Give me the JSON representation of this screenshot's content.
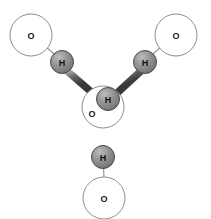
{
  "figure": {
    "background_color": "#ffffff",
    "width": 211,
    "height": 219
  },
  "style": {
    "oxygen_fill": "#ffffff",
    "oxygen_stroke": "#8d8d8d",
    "hydrogen_fill_light": "#b4b4b4",
    "hydrogen_fill_mid": "#8c8c8c",
    "hydrogen_fill_dark": "#6e6e6e",
    "hydrogen_stroke": "#4a4a4a",
    "covalent_bond_dark": "#3c3c3c",
    "covalent_bond_light": "#b9b9b9",
    "hydrogen_bond_color": "#9a9a9a",
    "label_color": "#1a1a1a"
  },
  "atoms": [
    {
      "id": "o-center",
      "element": "O",
      "label": "O",
      "kind": "oxygen",
      "cx": 103,
      "cy": 107,
      "r": 21,
      "label_x": 92,
      "label_y": 113
    },
    {
      "id": "o-top-left",
      "element": "O",
      "label": "O",
      "kind": "oxygen",
      "cx": 31,
      "cy": 35,
      "r": 21,
      "label_x": 31,
      "label_y": 35
    },
    {
      "id": "o-top-right",
      "element": "O",
      "label": "O",
      "kind": "oxygen",
      "cx": 176,
      "cy": 35,
      "r": 21,
      "label_x": 176,
      "label_y": 35
    },
    {
      "id": "o-bottom",
      "element": "O",
      "label": "O",
      "kind": "oxygen",
      "cx": 104,
      "cy": 198,
      "r": 21,
      "label_x": 104,
      "label_y": 198
    },
    {
      "id": "h-center",
      "element": "H",
      "label": "H",
      "kind": "hydrogen",
      "cx": 108,
      "cy": 99,
      "r": 11.5,
      "label_x": 108,
      "label_y": 99
    },
    {
      "id": "h-left",
      "element": "H",
      "label": "H",
      "kind": "hydrogen",
      "cx": 62,
      "cy": 62,
      "r": 11.5,
      "label_x": 62,
      "label_y": 62
    },
    {
      "id": "h-right",
      "element": "H",
      "label": "H",
      "kind": "hydrogen",
      "cx": 145,
      "cy": 62,
      "r": 11.5,
      "label_x": 145,
      "label_y": 62
    },
    {
      "id": "h-bottom",
      "element": "H",
      "label": "H",
      "kind": "hydrogen",
      "cx": 103,
      "cy": 157,
      "r": 11.5,
      "label_x": 103,
      "label_y": 157
    }
  ],
  "covalent_bonds": [
    {
      "id": "bond-center-h-left",
      "from": "o-center",
      "to": "h-left",
      "x1": 96,
      "y1": 95,
      "x2": 67,
      "y2": 70,
      "width": 7
    },
    {
      "id": "bond-center-h-right",
      "from": "o-center",
      "to": "h-right",
      "x1": 117,
      "y1": 93,
      "x2": 141,
      "y2": 70,
      "width": 7
    },
    {
      "id": "bond-center-h-bottom",
      "from": "o-center",
      "to": "h-bottom",
      "x1": 103,
      "y1": 118,
      "x2": 103,
      "y2": 152,
      "width": 7
    }
  ],
  "hydrogen_bonds": [
    {
      "id": "hbond-left",
      "from": "h-left",
      "to": "o-top-left",
      "x1": 54,
      "y1": 54,
      "x2": 45,
      "y2": 46
    },
    {
      "id": "hbond-right",
      "from": "h-right",
      "to": "o-top-right",
      "x1": 153,
      "y1": 54,
      "x2": 162,
      "y2": 46
    },
    {
      "id": "hbond-bottom",
      "from": "h-bottom",
      "to": "o-bottom",
      "x1": 103,
      "y1": 168,
      "x2": 104,
      "y2": 178
    }
  ]
}
